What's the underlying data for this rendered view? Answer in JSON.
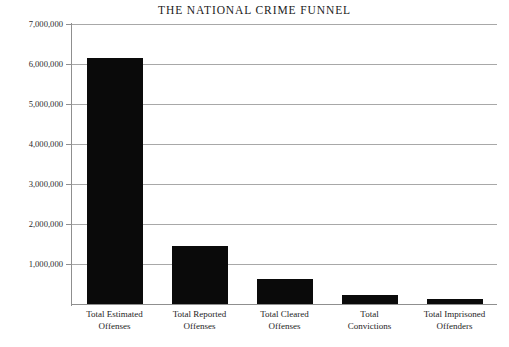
{
  "chart_data": {
    "type": "bar",
    "title": "THE NATIONAL CRIME FUNNEL",
    "xlabel": "",
    "ylabel": "",
    "categories": [
      "Total Estimated Offenses",
      "Total Reported Offenses",
      "Total Cleared Offenses",
      "Total Convictions",
      "Total Imprisoned Offenders"
    ],
    "category_lines": [
      [
        "Total Estimated",
        "Offenses"
      ],
      [
        "Total Reported",
        "Offenses"
      ],
      [
        "Total Cleared",
        "Offenses"
      ],
      [
        "Total",
        "Convictions"
      ],
      [
        "Total Imprisoned",
        "Offenders"
      ]
    ],
    "values": [
      6150000,
      1450000,
      630000,
      230000,
      130000
    ],
    "ylim": [
      0,
      7000000
    ],
    "ytick_values": [
      7000000,
      6000000,
      5000000,
      4000000,
      3000000,
      2000000,
      1000000
    ],
    "ytick_labels": [
      "7,000,000",
      "6,000,000",
      "5,000,000",
      "4,000,000",
      "3,000,000",
      "2,000,000",
      "1,000,000"
    ],
    "grid": true,
    "legend": false,
    "bar_color": "#0a0a0a",
    "gridline_color": "#a8a8a8",
    "axis_color": "#8f8f8f",
    "background_color": "#ffffff"
  }
}
